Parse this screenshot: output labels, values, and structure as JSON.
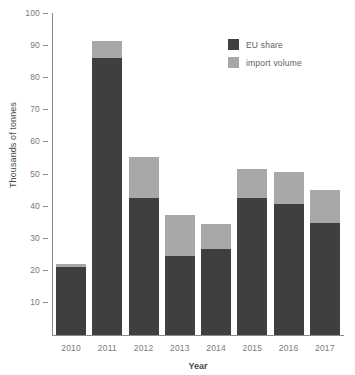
{
  "chart_data": {
    "type": "bar",
    "subtype": "stacked-bar",
    "title": "",
    "xlabel": "Year",
    "ylabel": "Thousands of tonnes",
    "categories": [
      "2010",
      "2011",
      "2012",
      "2013",
      "2014",
      "2015",
      "2016",
      "2017"
    ],
    "series": [
      {
        "name": "EU share",
        "color": "#3f3f3f",
        "values": [
          21.3,
          86.3,
          42.7,
          24.6,
          26.8,
          42.7,
          40.7,
          35.0
        ]
      },
      {
        "name": "import volume",
        "color": "#a8a8a8",
        "values": [
          0.8,
          5.2,
          12.7,
          12.8,
          7.8,
          9.0,
          10.1,
          10.2
        ]
      }
    ],
    "totals": [
      22.1,
      91.5,
      55.4,
      37.4,
      34.6,
      51.7,
      50.8,
      45.2
    ],
    "ylim": [
      0,
      100
    ],
    "yticks": [
      10,
      20,
      30,
      40,
      50,
      60,
      70,
      80,
      90,
      100
    ],
    "ytick_labels": [
      "10",
      "20",
      "30",
      "40",
      "50",
      "60",
      "70",
      "80",
      "90",
      "100"
    ],
    "grid": false,
    "legend_position": "top-right",
    "legend": [
      "EU share",
      "import volume"
    ]
  },
  "axes": {
    "y_title": "Thousands of tonnes",
    "x_title": "Year"
  }
}
